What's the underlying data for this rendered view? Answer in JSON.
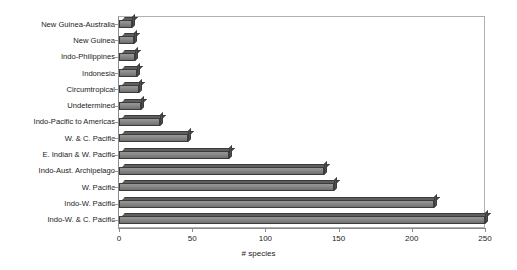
{
  "chart_data": {
    "type": "bar",
    "orientation": "horizontal",
    "title": "",
    "xlabel": "# species",
    "ylabel": "",
    "xlim": [
      0,
      250
    ],
    "xticks": [
      0,
      50,
      100,
      150,
      200,
      250
    ],
    "grid": false,
    "legend": null,
    "categories": [
      "New Guinea-Australia",
      "New Guinea",
      "Indo-Philippines",
      "Indonesia",
      "Circumtropical",
      "Undetermined",
      "Indo-Pacific to Americas",
      "W. & C. Pacific",
      "E. Indian & W. Pacific",
      "Indo-Aust. Archipelago",
      "W. Pacific",
      "Indo-W. Pacific",
      "Indo-W. & C. Pacific"
    ],
    "values": [
      9,
      10,
      11,
      12,
      14,
      15,
      28,
      47,
      75,
      140,
      147,
      215,
      250
    ],
    "bar_color": "#8c8c8c",
    "bar_edge_color": "#3c3c3c",
    "plot_border_color": "#b0b0b0",
    "background_color": "#ffffff"
  }
}
